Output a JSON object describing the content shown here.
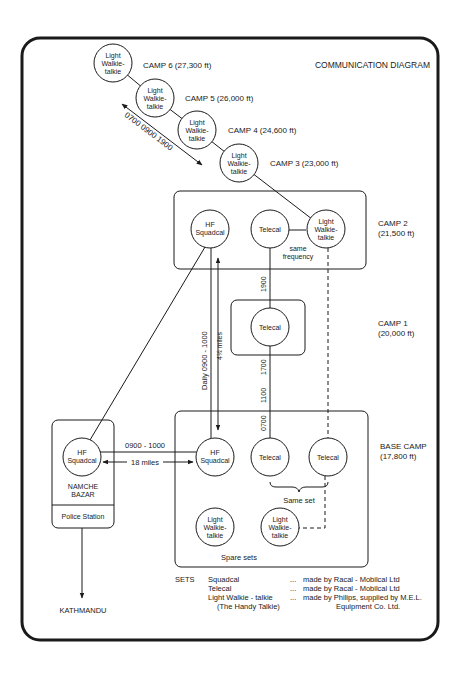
{
  "title": "COMMUNICATION DIAGRAM",
  "colors": {
    "ink": "#1a1a1a",
    "background": "#ffffff"
  },
  "upper_camps": [
    {
      "label": "CAMP 6  (27,300 ft)",
      "set": [
        "Light",
        "Walkie-",
        "talkie"
      ]
    },
    {
      "label": "CAMP 5  (26,000 ft)",
      "set": [
        "Light",
        "Walkie-",
        "talkie"
      ]
    },
    {
      "label": "CAMP 4  (24,600 ft)",
      "set": [
        "Light",
        "Walkie-",
        "talkie"
      ]
    },
    {
      "label": "CAMP 3  (23,000 ft)",
      "set": [
        "Light",
        "Walkie-",
        "talkie"
      ]
    }
  ],
  "upper_schedule": "0700  0900  1900",
  "camp2": {
    "label_line1": "CAMP 2",
    "label_line2": "(21,500 ft)",
    "hf": [
      "HF",
      "Squadcal"
    ],
    "telecal": "Telecal",
    "walkie": [
      "Light",
      "Walkie-",
      "talkie"
    ],
    "note_line1": "same",
    "note_line2": "frequency"
  },
  "camp1": {
    "label_line1": "CAMP 1",
    "label_line2": "(20,000 ft)",
    "telecal": "Telecal",
    "time_above": "1900",
    "times_below": [
      "1700",
      "1100",
      "0700"
    ]
  },
  "hf_link_vertical": {
    "schedule": "Daily 0900 - 1000",
    "distance": "4½ miles"
  },
  "base_camp": {
    "label_line1": "BASE CAMP",
    "label_line2": "(17,800 ft)",
    "hf": [
      "HF",
      "Squadcal"
    ],
    "telecal_a": "Telecal",
    "telecal_b": "Telecal",
    "same_set": "Same set",
    "spare_a": [
      "Light",
      "Walkie-",
      "talkie"
    ],
    "spare_b": [
      "Light",
      "Walkie-",
      "talkie"
    ],
    "spare_label": "Spare sets"
  },
  "namche": {
    "hf": [
      "HF",
      "Squadcal"
    ],
    "name_line1": "NAMCHE",
    "name_line2": "BAZAR",
    "police": "Police Station",
    "link_schedule": "0900 - 1000",
    "link_distance": "18 miles"
  },
  "destination": "KATHMANDU",
  "legend": {
    "heading": "SETS",
    "rows": [
      {
        "set": "Squadcal",
        "sep": "...",
        "maker": "made by Racal - Mobilcal Ltd"
      },
      {
        "set": "Telecal",
        "sep": "...",
        "maker": "made by Racal - Mobilcal Ltd"
      },
      {
        "set": "Light Walkie - talkie",
        "sep": "...",
        "maker": "made by  Philips, supplied by M.E.L."
      }
    ],
    "row3_sub_set": "(The Handy Talkie)",
    "row3_sub_maker": "Equipment Co. Ltd."
  }
}
